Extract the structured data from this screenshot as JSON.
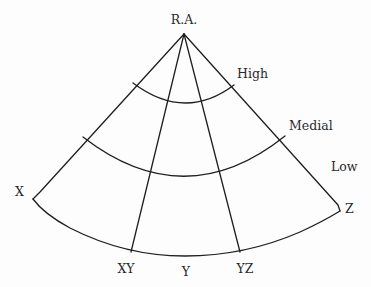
{
  "diagram": {
    "apex_label": "R.A.",
    "band_labels": [
      "High",
      "Medial",
      "Low"
    ],
    "corner_labels": {
      "left": "X",
      "right": "Z"
    },
    "bottom_labels": [
      "XY",
      "Y",
      "YZ"
    ],
    "colors": {
      "line": "#1e1e1e",
      "text": "#2a2a2a",
      "background": "#fdfdfd"
    }
  }
}
